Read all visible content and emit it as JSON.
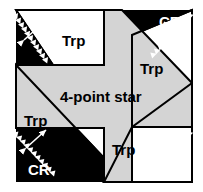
{
  "figure": {
    "canvas": {
      "width": 203,
      "height": 192
    },
    "frame": {
      "x": 16,
      "y": 10,
      "width": 176,
      "height": 172
    },
    "colors": {
      "background": "#ffffff",
      "corner_region_fill": "#000000",
      "corner_region_label": "#ffffff",
      "trapezoid_fill": "#ffffff",
      "star_fill": "#d4d4d4",
      "outline": "#000000",
      "arrow": "#ffffff",
      "label": "#000000"
    }
  },
  "star": {
    "label": "4-point star",
    "label_x": 60,
    "label_y": 89,
    "points": 4,
    "vertices": "104,10 122,10 192,83 192,127 132,127 132,182 104,182 104,128 16,128 16,65 104,65"
  },
  "trapezoids": [
    {
      "id": "trp-top",
      "label": "Trp",
      "label_x": 62,
      "label_y": 33
    },
    {
      "id": "trp-right",
      "label": "Trp",
      "label_x": 140,
      "label_y": 61
    },
    {
      "id": "trp-left",
      "label": "Trp",
      "label_x": 24,
      "label_y": 113
    },
    {
      "id": "trp-bottom",
      "label": "Trp",
      "label_x": 112,
      "label_y": 142
    }
  ],
  "corner_regions": [
    {
      "id": "cr-top-left",
      "label": "CR",
      "label_x": 28,
      "label_y": 14
    },
    {
      "id": "cr-top-right",
      "label": "CR",
      "label_x": 159,
      "label_y": 14
    },
    {
      "id": "cr-bottom-left",
      "label": "CR",
      "label_x": 28,
      "label_y": 162
    },
    {
      "id": "cr-bottom-right",
      "label": "CR",
      "label_x": 159,
      "label_y": 162
    }
  ]
}
